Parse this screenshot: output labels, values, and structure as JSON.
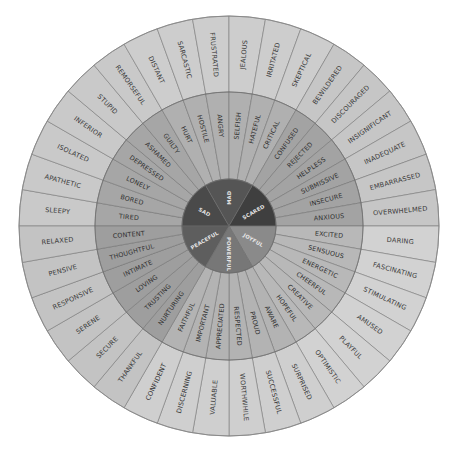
{
  "geometry": {
    "cx": 229,
    "cy": 226,
    "r_outer": 210,
    "r_middle": 134,
    "r_inner": 47,
    "start_deg": 270,
    "core_span": 60,
    "leaf_span": 10
  },
  "colors": {
    "outline": "#6a6a6a",
    "outer_ring": "#c8c8c8",
    "middle_ring": "#a9a9a9",
    "text_outer": "#3a3a3a",
    "text_middle": "#2f2f2f",
    "text_core": "#e6e6e6"
  },
  "groups": [
    {
      "core": "SAD",
      "core_color": "#4a4a4a",
      "middle_color": "#a6a6a6",
      "outer_color": "#c9c9c9",
      "middle": [
        "TIRED",
        "BORED",
        "LONELY",
        "DEPRESSED",
        "ASHAMED",
        "GUILTY"
      ],
      "outer": [
        "SLEEPY",
        "APATHETIC",
        "ISOLATED",
        "INFERIOR",
        "STUPID",
        "REMORSEFUL"
      ]
    },
    {
      "core": "MAD",
      "core_color": "#555555",
      "middle_color": "#b0b0b0",
      "outer_color": "#cdcdcd",
      "middle": [
        "HURT",
        "HOSTILE",
        "ANGRY",
        "SELFISH",
        "HATEFUL",
        "CRITICAL"
      ],
      "outer": [
        "DISTANT",
        "SARCASTIC",
        "FRUSTRATED",
        "JEALOUS",
        "IRRITATED",
        "SKEPTICAL"
      ]
    },
    {
      "core": "SCARED",
      "core_color": "#3f3f3f",
      "middle_color": "#a3a3a3",
      "outer_color": "#c6c6c6",
      "middle": [
        "CONFUSED",
        "REJECTED",
        "HELPLESS",
        "SUBMISSIVE",
        "INSECURE",
        "ANXIOUS"
      ],
      "outer": [
        "BEWILDERED",
        "DISCOURAGED",
        "INSIGNIFICANT",
        "INADEQUATE",
        "EMBARRASSED",
        "OVERWHELMED"
      ]
    },
    {
      "core": "JOYFUL",
      "core_color": "#8a8a8a",
      "middle_color": "#b8b8b8",
      "outer_color": "#d2d2d2",
      "middle": [
        "EXCITED",
        "SENSUOUS",
        "ENERGETIC",
        "CHEERFUL",
        "CREATIVE",
        "HOPEFUL"
      ],
      "outer": [
        "DARING",
        "FASCINATING",
        "STIMULATING",
        "AMUSED",
        "PLAYFUL",
        "OPTIMISTIC"
      ]
    },
    {
      "core": "POWERFUL",
      "core_color": "#777777",
      "middle_color": "#b3b3b3",
      "outer_color": "#cfcfcf",
      "middle": [
        "AWARE",
        "PROUD",
        "RESPECTED",
        "APPRECIATED",
        "IMPORTANT",
        "FAITHFUL"
      ],
      "outer": [
        "SURPRISED",
        "SUCCESSFUL",
        "WORTHWHILE",
        "VALUABLE",
        "DISCERNING",
        "CONFIDENT"
      ]
    },
    {
      "core": "PEACEFUL",
      "core_color": "#5e5e5e",
      "middle_color": "#9e9e9e",
      "outer_color": "#c3c3c3",
      "middle": [
        "NURTURING",
        "TRUSTING",
        "LOVING",
        "INTIMATE",
        "THOUGHTFUL",
        "CONTENT"
      ],
      "outer": [
        "THANKFUL",
        "SECURE",
        "SERENE",
        "RESPONSIVE",
        "PENSIVE",
        "RELAXED"
      ]
    }
  ]
}
